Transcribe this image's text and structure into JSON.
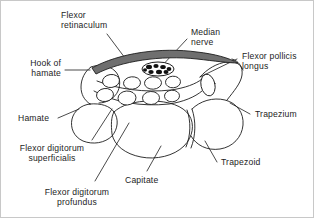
{
  "figure": {
    "background_color": "#ffffff",
    "border_color": "#c8c8c8",
    "line_color": "#1d1d1d",
    "retinaculum_fill": "#6f6f6f",
    "nerve_fill": "#ffffff",
    "nerve_speckle_color": "#111111",
    "width": 314,
    "height": 218
  },
  "labels": {
    "flexor_retinaculum": "Flexor\nretinaculum",
    "median_nerve": "Median\nnerve",
    "flexor_pollicis_longus": "Flexor pollicis\nlongus",
    "hook_of_hamate": "Hook of\nhamate",
    "hamate": "Hamate",
    "trapezium": "Trapezium",
    "trapezoid": "Trapezoid",
    "capitate": "Capitate",
    "flexor_digitorum_superficialis": "Flexor digitorum\nsuperficialis",
    "flexor_digitorum_profundus": "Flexor digitorum\nprofundus"
  }
}
